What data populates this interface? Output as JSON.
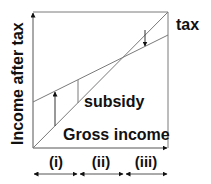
{
  "diagram": {
    "y_axis_label": "Income after tax",
    "labels": {
      "tax": "tax",
      "subsidy": "subsidy",
      "gross_income": "Gross income"
    },
    "regions": [
      {
        "label": "(i)"
      },
      {
        "label": "(ii)"
      },
      {
        "label": "(iii)"
      }
    ],
    "colors": {
      "line": "#7a7a7a",
      "arrow": "#111111",
      "text": "#111111"
    }
  }
}
